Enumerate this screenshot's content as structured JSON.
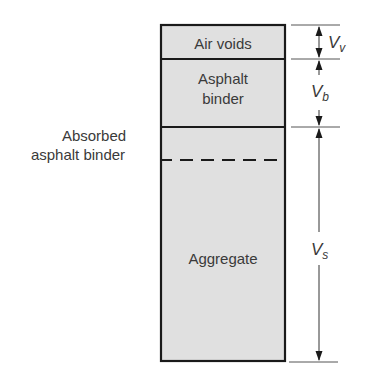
{
  "diagram": {
    "type": "phase-diagram",
    "fill_color": "#e0e0e0",
    "line_color": "#1a1a1a",
    "text_color": "#3a3a3a",
    "phases": [
      {
        "label_line1": "Air voids",
        "label_line2": "",
        "variable": "V",
        "subscript": "v"
      },
      {
        "label_line1": "Asphalt",
        "label_line2": "binder",
        "variable": "V",
        "subscript": "b"
      },
      {
        "label_line1": "Aggregate",
        "label_line2": "",
        "variable": "V",
        "subscript": "s"
      }
    ],
    "side_label": {
      "line1": "Absorbed",
      "line2": "asphalt binder"
    }
  }
}
